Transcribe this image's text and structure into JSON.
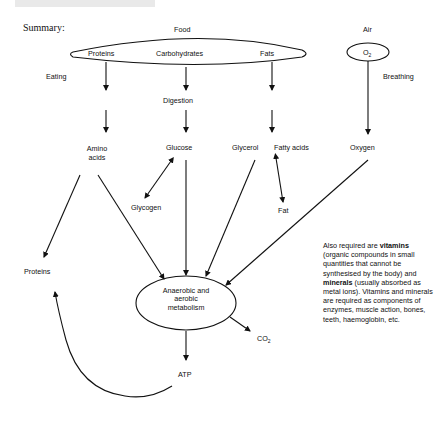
{
  "heading": {
    "note": "cropped heading band at top (not legible)"
  },
  "summary_label": "Summary:",
  "sources": {
    "food": "Food",
    "air": "Air",
    "food_items": [
      "Proteins",
      "Carbohydrates",
      "Fats"
    ],
    "air_item": {
      "main": "O",
      "sub": "2"
    }
  },
  "processes": {
    "eating": "Eating",
    "breathing": "Breathing",
    "digestion": "Digestion"
  },
  "products": {
    "amino_acids": "Amino acids",
    "glucose": "Glucose",
    "glycerol": "Glycerol",
    "fatty_acids": "Fatty acids",
    "oxygen": "Oxygen",
    "glycogen": "Glycogen",
    "fat": "Fat",
    "proteins": "Proteins"
  },
  "metabolism": {
    "line1": "Anaerobic and",
    "line2": "aerobic",
    "line3": "metabolism"
  },
  "outputs": {
    "co2": {
      "main": "CO",
      "sub": "2"
    },
    "atp": "ATP"
  },
  "note": {
    "p1": "Also required are ",
    "b1": "vitamins",
    "p2": " (organic compounds in small quantities that cannot be synthesised by the body) and ",
    "b2": "minerals",
    "p3": " (usually absorbed as metal ions). Vitamins and minerals are required as components of enzymes, muscle action, bones, teeth, haemoglobin, etc."
  }
}
